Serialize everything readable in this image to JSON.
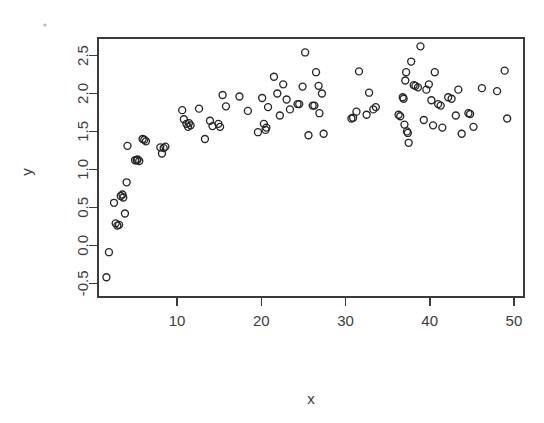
{
  "chart_data": {
    "type": "scatter",
    "title": "",
    "xlabel": "x",
    "ylabel": "y",
    "xlim": [
      0.6,
      51.2
    ],
    "ylim": [
      -0.68,
      2.73
    ],
    "xticks": [
      10,
      20,
      30,
      40,
      50
    ],
    "xticklabels": [
      "10",
      "20",
      "30",
      "40",
      "50"
    ],
    "yticks": [
      -0.5,
      0.0,
      0.5,
      1.0,
      1.5,
      2.0,
      2.5
    ],
    "yticklabels": [
      "-0.5",
      "0.0",
      "0.5",
      "1.0",
      "1.5",
      "2.0",
      "2.5"
    ],
    "grid": false,
    "legend": null,
    "marker": "open-circle",
    "marker_color": "#262626",
    "series": [
      {
        "name": "observations",
        "points": [
          [
            1.6,
            -0.42
          ],
          [
            1.9,
            -0.09
          ],
          [
            2.5,
            0.56
          ],
          [
            2.7,
            0.29
          ],
          [
            2.9,
            0.26
          ],
          [
            3.1,
            0.27
          ],
          [
            3.3,
            0.65
          ],
          [
            3.5,
            0.67
          ],
          [
            3.6,
            0.63
          ],
          [
            3.8,
            0.42
          ],
          [
            4.0,
            0.83
          ],
          [
            4.1,
            1.31
          ],
          [
            5.0,
            1.12
          ],
          [
            5.2,
            1.12
          ],
          [
            5.3,
            1.13
          ],
          [
            5.5,
            1.11
          ],
          [
            5.9,
            1.4
          ],
          [
            6.1,
            1.39
          ],
          [
            6.3,
            1.37
          ],
          [
            8.0,
            1.29
          ],
          [
            8.2,
            1.21
          ],
          [
            8.4,
            1.28
          ],
          [
            8.6,
            1.3
          ],
          [
            10.6,
            1.78
          ],
          [
            10.8,
            1.66
          ],
          [
            11.1,
            1.6
          ],
          [
            11.3,
            1.56
          ],
          [
            11.4,
            1.61
          ],
          [
            11.6,
            1.58
          ],
          [
            12.6,
            1.8
          ],
          [
            13.3,
            1.4
          ],
          [
            13.9,
            1.64
          ],
          [
            14.2,
            1.57
          ],
          [
            14.9,
            1.6
          ],
          [
            15.1,
            1.56
          ],
          [
            15.4,
            1.98
          ],
          [
            15.8,
            1.83
          ],
          [
            17.4,
            1.96
          ],
          [
            18.4,
            1.77
          ],
          [
            19.6,
            1.49
          ],
          [
            20.1,
            1.94
          ],
          [
            20.3,
            1.6
          ],
          [
            20.5,
            1.52
          ],
          [
            20.6,
            1.55
          ],
          [
            20.8,
            1.82
          ],
          [
            21.5,
            2.22
          ],
          [
            21.9,
            2.0
          ],
          [
            22.2,
            1.71
          ],
          [
            22.6,
            2.12
          ],
          [
            23.0,
            1.92
          ],
          [
            23.4,
            1.79
          ],
          [
            24.3,
            1.86
          ],
          [
            24.5,
            1.86
          ],
          [
            24.9,
            2.09
          ],
          [
            25.2,
            2.54
          ],
          [
            25.6,
            1.45
          ],
          [
            26.1,
            1.84
          ],
          [
            26.3,
            1.84
          ],
          [
            26.5,
            2.28
          ],
          [
            26.8,
            2.1
          ],
          [
            26.9,
            1.74
          ],
          [
            27.2,
            2.0
          ],
          [
            27.4,
            1.47
          ],
          [
            30.7,
            1.67
          ],
          [
            30.9,
            1.68
          ],
          [
            31.3,
            1.76
          ],
          [
            31.6,
            2.29
          ],
          [
            32.5,
            1.72
          ],
          [
            32.8,
            2.01
          ],
          [
            33.3,
            1.79
          ],
          [
            33.6,
            1.82
          ],
          [
            36.3,
            1.72
          ],
          [
            36.5,
            1.7
          ],
          [
            36.8,
            1.95
          ],
          [
            36.9,
            1.93
          ],
          [
            37.0,
            1.59
          ],
          [
            37.1,
            2.17
          ],
          [
            37.2,
            2.28
          ],
          [
            37.3,
            1.5
          ],
          [
            37.4,
            1.48
          ],
          [
            37.5,
            1.35
          ],
          [
            37.8,
            2.42
          ],
          [
            38.1,
            2.11
          ],
          [
            38.3,
            2.1
          ],
          [
            38.6,
            2.08
          ],
          [
            38.9,
            2.62
          ],
          [
            39.3,
            1.65
          ],
          [
            39.6,
            2.05
          ],
          [
            39.9,
            2.12
          ],
          [
            40.2,
            1.91
          ],
          [
            40.4,
            1.58
          ],
          [
            40.6,
            2.28
          ],
          [
            41.0,
            1.86
          ],
          [
            41.3,
            1.84
          ],
          [
            41.5,
            1.55
          ],
          [
            42.2,
            1.95
          ],
          [
            42.6,
            1.93
          ],
          [
            43.1,
            1.71
          ],
          [
            43.4,
            2.05
          ],
          [
            43.8,
            1.47
          ],
          [
            44.6,
            1.74
          ],
          [
            44.8,
            1.73
          ],
          [
            45.2,
            1.56
          ],
          [
            46.2,
            2.07
          ],
          [
            48.0,
            2.03
          ],
          [
            48.9,
            2.3
          ],
          [
            49.2,
            1.67
          ]
        ]
      }
    ]
  },
  "axes": {
    "y_title": "y",
    "x_title": "x"
  }
}
